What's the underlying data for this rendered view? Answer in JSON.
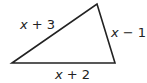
{
  "diagram": {
    "type": "triangle",
    "vertices": [
      [
        12,
        63
      ],
      [
        97,
        4
      ],
      [
        115,
        63
      ]
    ],
    "stroke_color": "#222222",
    "sides": [
      {
        "id": "left",
        "label_var": "x",
        "label_rest": " + 3"
      },
      {
        "id": "right",
        "label_var": "x",
        "label_rest": " − 1"
      },
      {
        "id": "bottom",
        "label_var": "x",
        "label_rest": " + 2"
      }
    ]
  }
}
